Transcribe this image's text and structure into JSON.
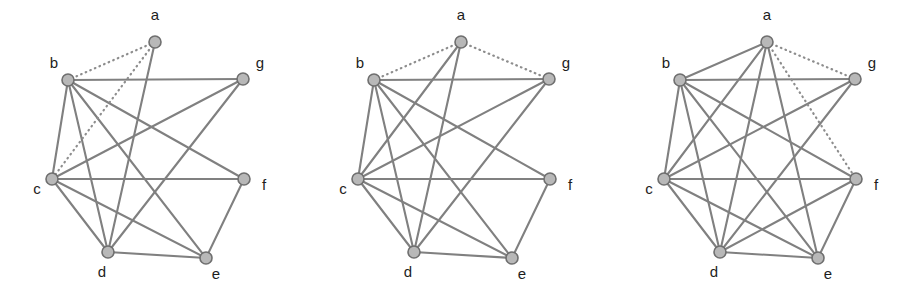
{
  "figure": {
    "panel_count": 3,
    "background_color": "#ffffff"
  },
  "style": {
    "solid_edge_color": "#808080",
    "dotted_edge_color": "#8d8d8d",
    "node_fill_color": "#b8b8b8",
    "node_stroke_color": "#6f6f6f",
    "label_color": "#1d1d1d",
    "node_radius": 6.0,
    "solid_edge_width": 2.1,
    "dotted_edge_width": 2.2
  },
  "node_positions": {
    "a": {
      "x": 155,
      "y": 42,
      "label_x": 155,
      "label_y": 20,
      "label_anchor": "middle"
    },
    "b": {
      "x": 68,
      "y": 80,
      "label_x": 54,
      "label_y": 68,
      "label_anchor": "middle"
    },
    "c": {
      "x": 52,
      "y": 179,
      "label_x": 37,
      "label_y": 194,
      "label_anchor": "middle"
    },
    "d": {
      "x": 108,
      "y": 252,
      "label_x": 102,
      "label_y": 277,
      "label_anchor": "middle"
    },
    "e": {
      "x": 206,
      "y": 258,
      "label_x": 216,
      "label_y": 279,
      "label_anchor": "middle"
    },
    "f": {
      "x": 244,
      "y": 179,
      "label_x": 264,
      "label_y": 190,
      "label_anchor": "middle"
    },
    "g": {
      "x": 243,
      "y": 79,
      "label_x": 260,
      "label_y": 68,
      "label_anchor": "middle"
    }
  },
  "node_order": [
    "a",
    "b",
    "c",
    "d",
    "e",
    "f",
    "g"
  ],
  "panels": [
    {
      "id": "graph-1",
      "index": 1,
      "node_labels": {
        "a": "a",
        "b": "b",
        "c": "c",
        "d": "d",
        "e": "e",
        "f": "f",
        "g": "g"
      },
      "solid_edges": [
        [
          "a",
          "d"
        ],
        [
          "b",
          "c"
        ],
        [
          "b",
          "d"
        ],
        [
          "b",
          "e"
        ],
        [
          "b",
          "f"
        ],
        [
          "b",
          "g"
        ],
        [
          "c",
          "d"
        ],
        [
          "c",
          "e"
        ],
        [
          "c",
          "f"
        ],
        [
          "d",
          "e"
        ],
        [
          "d",
          "g"
        ],
        [
          "e",
          "f"
        ],
        [
          "c",
          "g"
        ]
      ],
      "dotted_edges": [
        [
          "a",
          "b"
        ],
        [
          "a",
          "c"
        ]
      ],
      "solid_edge_count": 13,
      "dotted_edge_count": 2
    },
    {
      "id": "graph-2",
      "index": 2,
      "node_labels": {
        "a": "a",
        "b": "b",
        "c": "c",
        "d": "d",
        "e": "e",
        "f": "f",
        "g": "g"
      },
      "solid_edges": [
        [
          "a",
          "c"
        ],
        [
          "a",
          "d"
        ],
        [
          "b",
          "c"
        ],
        [
          "b",
          "d"
        ],
        [
          "b",
          "e"
        ],
        [
          "b",
          "f"
        ],
        [
          "b",
          "g"
        ],
        [
          "c",
          "d"
        ],
        [
          "c",
          "e"
        ],
        [
          "c",
          "f"
        ],
        [
          "c",
          "g"
        ],
        [
          "d",
          "e"
        ],
        [
          "d",
          "g"
        ],
        [
          "e",
          "f"
        ]
      ],
      "dotted_edges": [
        [
          "a",
          "b"
        ],
        [
          "a",
          "g"
        ]
      ],
      "solid_edge_count": 14,
      "dotted_edge_count": 2
    },
    {
      "id": "graph-3",
      "index": 3,
      "node_labels": {
        "a": "a",
        "b": "b",
        "c": "c",
        "d": "d",
        "e": "e",
        "f": "f",
        "g": "g"
      },
      "solid_edges": [
        [
          "a",
          "b"
        ],
        [
          "a",
          "c"
        ],
        [
          "a",
          "d"
        ],
        [
          "a",
          "e"
        ],
        [
          "b",
          "c"
        ],
        [
          "b",
          "d"
        ],
        [
          "b",
          "e"
        ],
        [
          "b",
          "f"
        ],
        [
          "b",
          "g"
        ],
        [
          "c",
          "d"
        ],
        [
          "c",
          "e"
        ],
        [
          "c",
          "f"
        ],
        [
          "c",
          "g"
        ],
        [
          "d",
          "e"
        ],
        [
          "d",
          "f"
        ],
        [
          "d",
          "g"
        ],
        [
          "e",
          "f"
        ]
      ],
      "dotted_edges": [
        [
          "a",
          "f"
        ],
        [
          "a",
          "g"
        ]
      ],
      "solid_edge_count": 17,
      "dotted_edge_count": 2
    }
  ]
}
